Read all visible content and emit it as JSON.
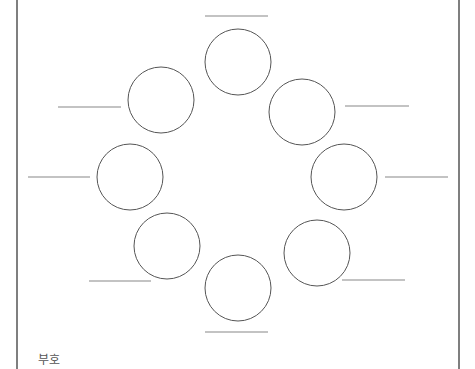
{
  "diagram": {
    "caption": "부호",
    "stroke_color": "#555555",
    "line_color": "#888888",
    "border_color": "#555555",
    "border": {
      "left_x": 17,
      "right_x": 459
    },
    "circle_radius": 33,
    "nodes": [
      {
        "id": "top",
        "cx": 238,
        "cy": 62,
        "label": "",
        "blank": {
          "x1": 205,
          "x2": 268,
          "y": 16
        }
      },
      {
        "id": "upper-left",
        "cx": 161,
        "cy": 100,
        "label": "",
        "blank": {
          "x1": 58,
          "x2": 121,
          "y": 107
        }
      },
      {
        "id": "upper-right",
        "cx": 302,
        "cy": 112,
        "label": "",
        "blank": {
          "x1": 345,
          "x2": 409,
          "y": 106
        }
      },
      {
        "id": "left",
        "cx": 130,
        "cy": 177,
        "label": "",
        "blank": {
          "x1": 28,
          "x2": 90,
          "y": 177
        }
      },
      {
        "id": "right",
        "cx": 344,
        "cy": 177,
        "label": "",
        "blank": {
          "x1": 385,
          "x2": 448,
          "y": 177
        }
      },
      {
        "id": "lower-left",
        "cx": 167,
        "cy": 246,
        "label": "",
        "blank": {
          "x1": 89,
          "x2": 151,
          "y": 281
        }
      },
      {
        "id": "lower-right",
        "cx": 317,
        "cy": 253,
        "label": "",
        "blank": {
          "x1": 342,
          "x2": 405,
          "y": 280
        }
      },
      {
        "id": "bottom",
        "cx": 238,
        "cy": 288,
        "label": "",
        "blank": {
          "x1": 205,
          "x2": 268,
          "y": 332
        }
      }
    ]
  }
}
